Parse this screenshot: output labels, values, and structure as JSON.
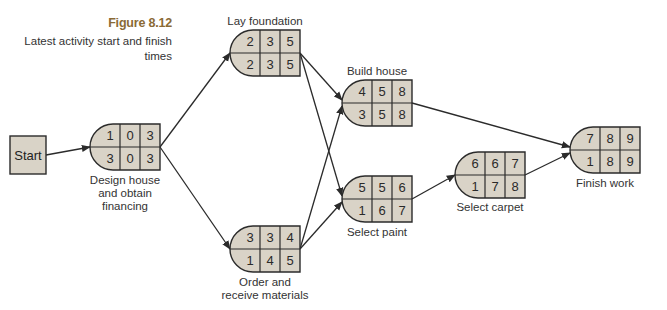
{
  "figure": {
    "number": "Figure 8.12",
    "caption": "Latest activity start and finish times"
  },
  "colors": {
    "node_fill": "#d9d3c7",
    "stroke": "#2b2b2b",
    "figure_number": "#8a6a35"
  },
  "start_node": {
    "label": "Start"
  },
  "nodes": [
    {
      "id": "design",
      "label": "Design house and obtain financing",
      "label_lines": [
        "Design house",
        "and obtain",
        "financing"
      ],
      "top": [
        "1",
        "0",
        "3"
      ],
      "bottom": [
        "3",
        "0",
        "3"
      ]
    },
    {
      "id": "foundation",
      "label": "Lay foundation",
      "label_lines": [
        "Lay foundation"
      ],
      "top": [
        "2",
        "3",
        "5"
      ],
      "bottom": [
        "2",
        "3",
        "5"
      ]
    },
    {
      "id": "materials",
      "label": "Order and receive materials",
      "label_lines": [
        "Order and",
        "receive materials"
      ],
      "top": [
        "3",
        "3",
        "4"
      ],
      "bottom": [
        "1",
        "4",
        "5"
      ]
    },
    {
      "id": "house",
      "label": "Build house",
      "label_lines": [
        "Build house"
      ],
      "top": [
        "4",
        "5",
        "8"
      ],
      "bottom": [
        "3",
        "5",
        "8"
      ]
    },
    {
      "id": "paint",
      "label": "Select paint",
      "label_lines": [
        "Select paint"
      ],
      "top": [
        "5",
        "5",
        "6"
      ],
      "bottom": [
        "1",
        "6",
        "7"
      ]
    },
    {
      "id": "carpet",
      "label": "Select carpet",
      "label_lines": [
        "Select carpet"
      ],
      "top": [
        "6",
        "6",
        "7"
      ],
      "bottom": [
        "1",
        "7",
        "8"
      ]
    },
    {
      "id": "finish",
      "label": "Finish work",
      "label_lines": [
        "Finish work"
      ],
      "top": [
        "7",
        "8",
        "9"
      ],
      "bottom": [
        "1",
        "8",
        "9"
      ]
    }
  ],
  "edges": [
    [
      "start",
      "design"
    ],
    [
      "design",
      "foundation"
    ],
    [
      "design",
      "materials"
    ],
    [
      "foundation",
      "house"
    ],
    [
      "foundation",
      "paint"
    ],
    [
      "materials",
      "house"
    ],
    [
      "materials",
      "paint"
    ],
    [
      "house",
      "finish"
    ],
    [
      "paint",
      "carpet"
    ],
    [
      "carpet",
      "finish"
    ]
  ]
}
